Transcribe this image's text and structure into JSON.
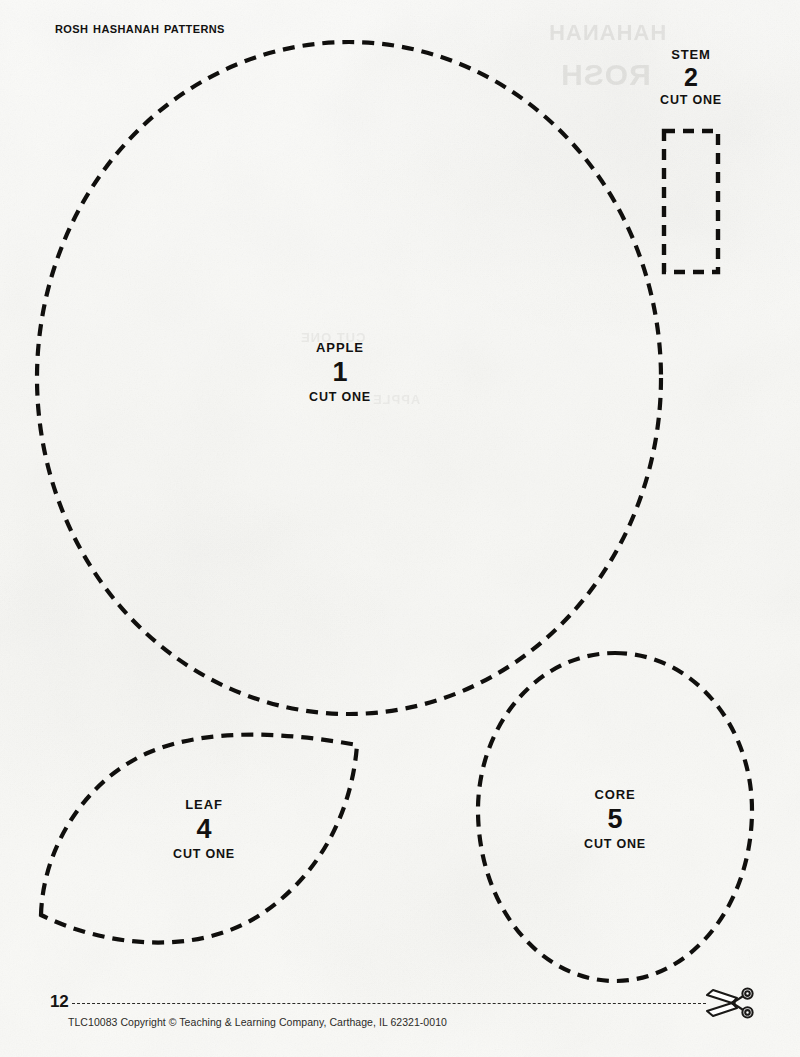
{
  "page": {
    "title": "Rosh Hashanah Patterns",
    "number": "12",
    "copyright": "TLC10083 Copyright © Teaching & Learning Company, Carthage, IL  62321-0010",
    "background_color": "#faf9f6",
    "ink_color": "#100f0d"
  },
  "pieces": [
    {
      "id": "apple",
      "name": "APPLE",
      "number": "1",
      "cut_instruction": "CUT ONE",
      "shape": "circle"
    },
    {
      "id": "stem",
      "name": "STEM",
      "number": "2",
      "cut_instruction": "CUT ONE",
      "shape": "rectangle"
    },
    {
      "id": "leaf",
      "name": "LEAF",
      "number": "4",
      "cut_instruction": "CUT ONE",
      "shape": "lens"
    },
    {
      "id": "core",
      "name": "CORE",
      "number": "5",
      "cut_instruction": "CUT ONE",
      "shape": "oval"
    }
  ],
  "footer": {
    "page_number": "12",
    "copyright": "TLC10083 Copyright © Teaching & Learning Company, Carthage, IL  62321-0010",
    "scissors_icon": "scissors-icon",
    "cut_line_style": "dashed"
  },
  "ghosting": {
    "line1": "HAHANAH",
    "line2": "ROSH",
    "line3": "CUT ONE",
    "line4": "APPLE"
  }
}
